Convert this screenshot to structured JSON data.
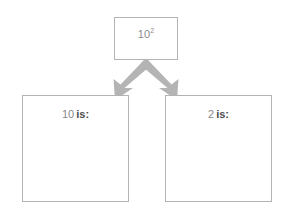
{
  "diagram": {
    "background_color": "#ffffff",
    "border_color": "#b3b3b3",
    "arrow_color": "#b0b0b0",
    "text_color": "#8a8a8a",
    "bold_text_color": "#4d4d4d"
  },
  "top_node": {
    "base": "10",
    "exponent": "2",
    "full_text": "10²"
  },
  "branches": [
    {
      "id": "left",
      "base_label": "10",
      "is_label": "is:",
      "answer": "",
      "direction": "down-left"
    },
    {
      "id": "right",
      "base_label": "2",
      "is_label": "is:",
      "answer": "",
      "direction": "down-right"
    }
  ],
  "arrows": {
    "origin": {
      "x": 146,
      "y": 60
    },
    "left_tip": {
      "x": 107,
      "y": 93
    },
    "right_tip": {
      "x": 187,
      "y": 93
    }
  }
}
